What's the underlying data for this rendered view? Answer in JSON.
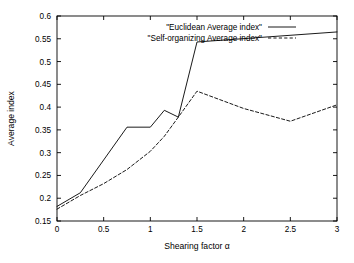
{
  "chart_data": {
    "type": "line",
    "title": "",
    "xlabel": "Shearing factor α",
    "ylabel": "Average index",
    "xlim": [
      0,
      3
    ],
    "ylim": [
      0.15,
      0.6
    ],
    "grid": false,
    "legend_position": "top-center",
    "xticks": [
      "0",
      "0.5",
      "1",
      "1.5",
      "2",
      "2.5",
      "3"
    ],
    "xtick_values": [
      0,
      0.5,
      1,
      1.5,
      2,
      2.5,
      3
    ],
    "yticks": [
      "0.15",
      "0.2",
      "0.25",
      "0.3",
      "0.35",
      "0.4",
      "0.45",
      "0.5",
      "0.55",
      "0.6"
    ],
    "ytick_values": [
      0.15,
      0.2,
      0.25,
      0.3,
      0.35,
      0.4,
      0.45,
      0.5,
      0.55,
      0.6
    ],
    "series": [
      {
        "name": "\"Euclidean Average index\"",
        "style": "solid",
        "x": [
          0,
          0.25,
          0.75,
          1.0,
          1.15,
          1.3,
          1.5,
          3.0
        ],
        "values": [
          0.182,
          0.212,
          0.356,
          0.356,
          0.393,
          0.378,
          0.543,
          0.565
        ]
      },
      {
        "name": "\"Self-organizing Average index\"",
        "style": "dashed",
        "x": [
          0,
          0.25,
          0.5,
          0.75,
          1.0,
          1.15,
          1.3,
          1.5,
          2.0,
          2.5,
          3.0
        ],
        "values": [
          0.176,
          0.206,
          0.232,
          0.263,
          0.303,
          0.336,
          0.378,
          0.435,
          0.397,
          0.369,
          0.405
        ]
      }
    ]
  },
  "geometry": {
    "plot_left": 57,
    "plot_right": 337,
    "plot_top": 16,
    "plot_bottom": 221,
    "legend_text_right": 262,
    "legend_sample_x1": 268,
    "legend_sample_x2": 296,
    "legend_row1_y": 27,
    "legend_row2_y": 38
  }
}
